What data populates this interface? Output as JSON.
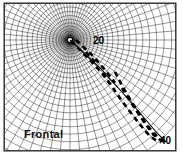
{
  "figure": {
    "title": "Frontal",
    "caption": "Frontal",
    "width_px": 183,
    "height_px": 158,
    "background_color": "#ffffff",
    "frame_color": "#2b2b2b"
  },
  "mesh": {
    "type": "polar-body-fitted-grid",
    "line_color": "#1a1a1a",
    "singularity_label": "grid-singularity",
    "center": {
      "x": 70,
      "y": 40
    },
    "radial_ring_count": 26,
    "angular_spoke_count": 72,
    "inner_radius": 4,
    "outer_radius": 135
  },
  "contours": {
    "line_color": "#000000",
    "style": "dashed",
    "items": [
      {
        "label": "20",
        "label_x": 93,
        "label_y": 44
      },
      {
        "label": "40",
        "label_x": 166,
        "label_y": 140
      }
    ]
  },
  "labels": {
    "contour_20": "20",
    "contour_40": "40",
    "view_name": "Frontal"
  }
}
